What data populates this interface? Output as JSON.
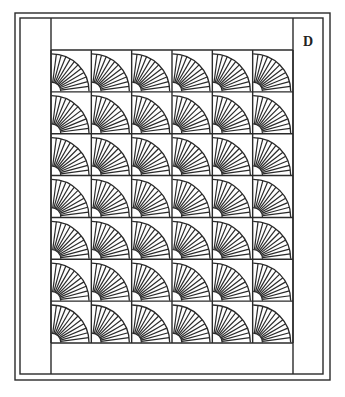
{
  "diagram": {
    "label": "D",
    "colors": {
      "stroke": "#2a2a2a",
      "background": "#ffffff"
    },
    "frame": {
      "outer": {
        "x": 15,
        "y": 13,
        "w": 315,
        "h": 367
      },
      "inner": {
        "x": 20,
        "y": 18,
        "w": 303,
        "h": 356
      }
    },
    "sidebars": {
      "left_x": 51,
      "right_x": 293
    },
    "grid": {
      "rows": 7,
      "cols": 6,
      "x0": 51,
      "y0": 50,
      "x1": 293,
      "y1": 343
    },
    "block": {
      "type": "fan",
      "rays": 11,
      "outer_radius_ratio": 0.93,
      "inner_radius_ratio": 0.23
    }
  }
}
